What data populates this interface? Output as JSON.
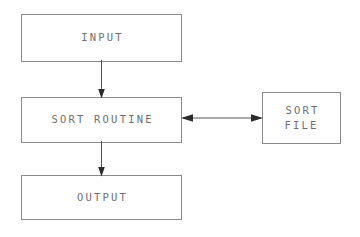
{
  "diagram": {
    "background_color": "#ffffff",
    "line_color": "#8a8a8a",
    "text_color": "#6f6f6f",
    "arrow_color": "#2b2b2b",
    "nodes": [
      {
        "id": "input",
        "label": "INPUT",
        "shape": "rectangle"
      },
      {
        "id": "sort_routine",
        "label": "SORT ROUTINE",
        "shape": "rectangle"
      },
      {
        "id": "output",
        "label": "OUTPUT",
        "shape": "rectangle"
      },
      {
        "id": "sort_file",
        "label": "SORT\nFILE",
        "shape": "rectangle"
      }
    ],
    "edges": [
      {
        "id": "input_to_sort",
        "from": "input",
        "to": "sort_routine",
        "direction": "down",
        "arrowheads": 1
      },
      {
        "id": "sort_to_output",
        "from": "sort_routine",
        "to": "output",
        "direction": "down",
        "arrowheads": 1
      },
      {
        "id": "sort_file_link",
        "from": "sort_routine",
        "to": "sort_file",
        "direction": "bidirectional",
        "arrowheads": 2
      }
    ]
  }
}
